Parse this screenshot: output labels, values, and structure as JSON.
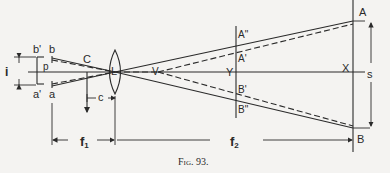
{
  "figure": {
    "caption": "Fig. 93.",
    "labels": {
      "i": "i",
      "b_prime": "b'",
      "b": "b",
      "p": "p",
      "a_prime": "a'",
      "a": "a",
      "C": "C",
      "L": "L",
      "c": "c",
      "V": "V",
      "Y": "Y",
      "A_double_prime": "A\"",
      "A_prime": "A'",
      "B_prime": "B'",
      "B_double_prime": "B\"",
      "A": "A",
      "B": "B",
      "X": "X",
      "s": "s",
      "f1": "f",
      "f1_sub": "1",
      "f2": "f",
      "f2_sub": "2"
    }
  }
}
